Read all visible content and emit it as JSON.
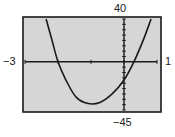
{
  "chart_data": {
    "type": "line",
    "title": "",
    "xlabel": "",
    "ylabel": "",
    "xlim": [
      -3,
      1
    ],
    "ylim": [
      -45,
      40
    ],
    "window_labels": {
      "xmin": "−3",
      "xmax": "1",
      "ymax": "40",
      "ymin": "−45"
    },
    "grid": false,
    "series": [
      {
        "name": "parabola",
        "x": [
          -2.36,
          -2.18,
          -2.0,
          -1.76,
          -1.45,
          -1.09,
          -0.73,
          -0.36,
          0.0,
          0.3,
          0.58,
          0.82
        ],
        "y": [
          40,
          20,
          0,
          -17,
          -33,
          -39,
          -38,
          -30,
          -17,
          0,
          20,
          40
        ]
      }
    ],
    "annotations": {
      "x_intercepts": [
        -2.0,
        0.3
      ],
      "y_intercept": -17,
      "minimum": {
        "x": -1.0,
        "y": -39
      }
    },
    "x_ticks": [
      -3,
      -2,
      -1,
      0,
      1
    ],
    "y_tick_spacing": 5
  },
  "colors": {
    "screen_bg": "#d6d6d6",
    "frame": "#1a1a1a",
    "axis": "#1a1a1a",
    "curve": "#1a1a1a",
    "text": "#222222"
  }
}
